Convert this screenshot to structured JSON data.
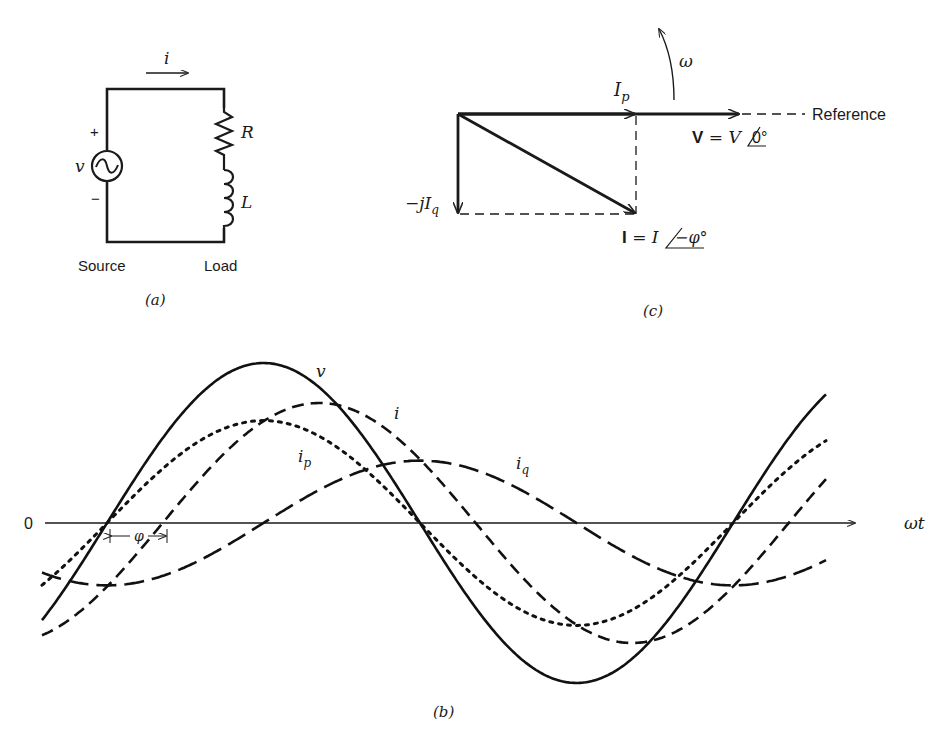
{
  "figure": {
    "panel_a": {
      "caption": "(a)",
      "current_label": "i",
      "voltage_label": "v",
      "plus_sign": "+",
      "minus_sign": "−",
      "resistor_label": "R",
      "inductor_label": "L",
      "source_caption": "Source",
      "load_caption": "Load"
    },
    "panel_c": {
      "caption": "(c)",
      "ip_label": "I",
      "ip_sub": "p",
      "iq_label_prefix": "−jI",
      "iq_sub": "q",
      "omega_label": "ω",
      "reference_label": "Reference",
      "v_phasor_bold": "V",
      "v_phasor_eq": " = V",
      "v_phasor_angle": "0°",
      "i_phasor_bold": "I",
      "i_phasor_eq": " = I",
      "i_phasor_angle": "−φ°"
    },
    "panel_b": {
      "caption": "(b)",
      "origin_label": "0",
      "x_axis_label": "ωt",
      "phi_label": "φ",
      "curve_labels": {
        "v": "v",
        "i": "i",
        "ip": "i",
        "ip_sub": "p",
        "iq": "i",
        "iq_sub": "q"
      }
    }
  },
  "chart_data": {
    "type": "line",
    "title": "",
    "xlabel": "ωt",
    "ylabel": "",
    "axis": {
      "origin_label": "0",
      "grid": false
    },
    "x_degrees_range": [
      -60,
      385
    ],
    "phase_lag_phi_deg": 32,
    "series": [
      {
        "name": "v",
        "style": "solid",
        "amplitude": 1.0,
        "phase_deg": 0
      },
      {
        "name": "i",
        "style": "dashed",
        "amplitude": 0.75,
        "phase_deg": -32
      },
      {
        "name": "i_p",
        "style": "dotted",
        "amplitude": 0.64,
        "phase_deg": 0
      },
      {
        "name": "i_q",
        "style": "long-dashed",
        "amplitude": 0.39,
        "phase_deg": -90
      }
    ]
  }
}
